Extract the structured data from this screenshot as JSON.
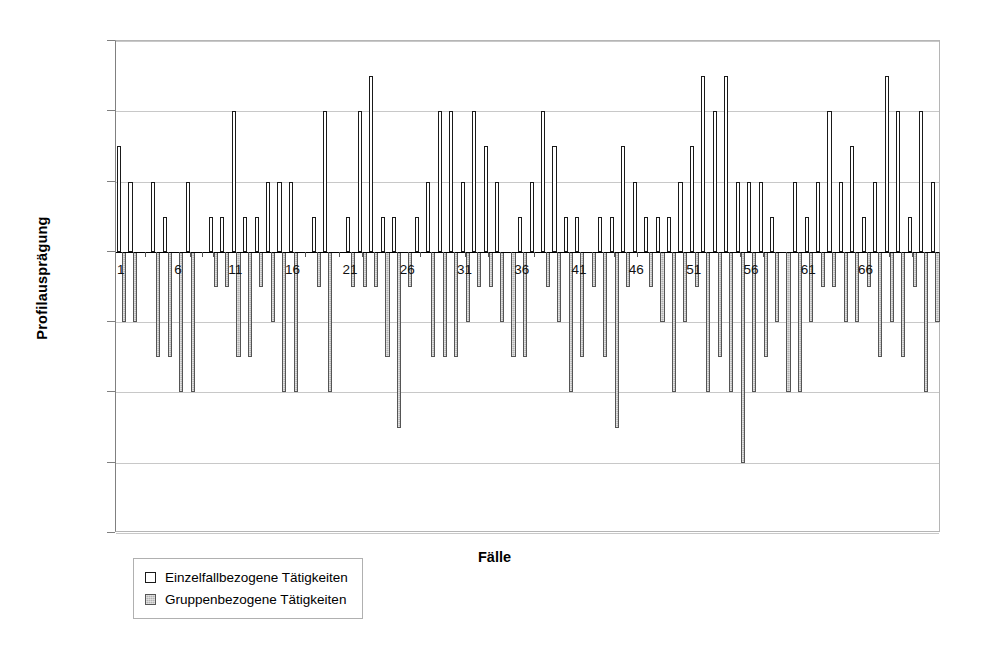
{
  "chart_data": {
    "type": "bar",
    "title": "",
    "xlabel": "Fälle",
    "ylabel": "Profilausprägung",
    "ylim": [
      -8,
      6
    ],
    "yticks": [
      6,
      4,
      2,
      0,
      -2,
      -4,
      -6,
      -8
    ],
    "ytick_labels": [
      "6",
      "4",
      "2",
      "0",
      "-2",
      "-4",
      "-6",
      "-8"
    ],
    "xticks": [
      1,
      6,
      11,
      16,
      21,
      26,
      31,
      36,
      41,
      46,
      51,
      56,
      61,
      66
    ],
    "xtick_labels": [
      "1",
      "6",
      "11",
      "16",
      "21",
      "26",
      "31",
      "36",
      "41",
      "46",
      "51",
      "56",
      "61",
      "66"
    ],
    "grid": true,
    "legend_position": "below-left",
    "categories": [
      1,
      2,
      3,
      4,
      5,
      6,
      7,
      8,
      9,
      10,
      11,
      12,
      13,
      14,
      15,
      16,
      17,
      18,
      19,
      20,
      21,
      22,
      23,
      24,
      25,
      26,
      27,
      28,
      29,
      30,
      31,
      32,
      33,
      34,
      35,
      36,
      37,
      38,
      39,
      40,
      41,
      42,
      43,
      44,
      45,
      46,
      47,
      48,
      49,
      50,
      51,
      52,
      53,
      54,
      55,
      56,
      57,
      58,
      59,
      60,
      61,
      62,
      63,
      64,
      65,
      66,
      67,
      68,
      69,
      70,
      71,
      72
    ],
    "series": [
      {
        "name": "Einzelfallbezogene Tätigkeiten",
        "color": "#ffffff",
        "edge_color": "#1a1a1a",
        "values": [
          3,
          2,
          0,
          2,
          1,
          0,
          2,
          0,
          1,
          1,
          4,
          1,
          1,
          2,
          2,
          2,
          0,
          1,
          4,
          0,
          1,
          4,
          5,
          1,
          1,
          0,
          1,
          2,
          4,
          4,
          2,
          4,
          3,
          2,
          0,
          1,
          2,
          4,
          3,
          1,
          1,
          0,
          1,
          1,
          3,
          2,
          1,
          1,
          1,
          2,
          3,
          5,
          4,
          5,
          2,
          2,
          2,
          1,
          0,
          2,
          1,
          2,
          4,
          2,
          3,
          1,
          2,
          5,
          4,
          1,
          4,
          2
        ]
      },
      {
        "name": "Gruppenbezogene Tätigkeiten",
        "color": "#b3b3b3",
        "edge_color": "#555555",
        "values": [
          -2,
          -2,
          0,
          -3,
          -3,
          -4,
          -4,
          0,
          -1,
          -1,
          -3,
          -3,
          -1,
          -2,
          -4,
          -4,
          0,
          -1,
          -4,
          0,
          -1,
          -1,
          -1,
          -3,
          -5,
          -1,
          0,
          -3,
          -3,
          -3,
          -2,
          -1,
          -1,
          -2,
          -3,
          -3,
          0,
          -1,
          -2,
          -4,
          -3,
          -1,
          -3,
          -5,
          -1,
          0,
          -1,
          -2,
          -4,
          -2,
          -1,
          -4,
          -3,
          -4,
          -6,
          -4,
          -3,
          -2,
          -4,
          -4,
          -2,
          -1,
          -1,
          -2,
          -2,
          -1,
          -3,
          -2,
          -3,
          -1,
          -4,
          -2
        ]
      }
    ]
  },
  "legend": {
    "items": [
      {
        "label": "Einzelfallbezogene Tätigkeiten",
        "swatch": "white"
      },
      {
        "label": "Gruppenbezogene Tätigkeiten",
        "swatch": "gray"
      }
    ]
  }
}
